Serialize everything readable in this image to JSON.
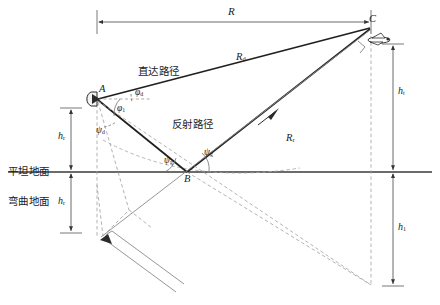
{
  "diagram": {
    "background": "#ffffff",
    "stroke_solid": "#262626",
    "stroke_dashed": "#9a9a9a",
    "stroke_thin": "#8c8c8c",
    "ground_color": "#3a3a3a"
  },
  "points": {
    "a": {
      "label": "A",
      "x": 97,
      "y": 98,
      "desc": "radar-antenna-point"
    },
    "b": {
      "label": "B",
      "x": 187,
      "y": 172,
      "desc": "ground-reflection-point"
    },
    "c": {
      "label": "C",
      "x": 371,
      "y": 26,
      "desc": "target-aircraft-point"
    }
  },
  "paths": {
    "direct_label": "直达路径",
    "reflected_label": "反射路径",
    "direct_range": "R",
    "direct_range_sub": "d",
    "reflected_range": "R",
    "reflected_range_sub": "r"
  },
  "dimensions": {
    "range": {
      "symbol": "R",
      "sub": "",
      "desc": "horizontal ground range"
    },
    "radar_height": {
      "symbol": "h",
      "sub": "r",
      "desc": "radar antenna height"
    },
    "target_height": {
      "symbol": "h",
      "sub": "t",
      "desc": "target height above flat ground"
    },
    "image_height": {
      "symbol": "h",
      "sub": "1",
      "desc": "image height below ground"
    },
    "mirror_radar_height": {
      "symbol": "h",
      "sub": "r",
      "desc": "mirrored radar height"
    }
  },
  "angles": {
    "phi_d": {
      "symbol": "φ",
      "sub": "d",
      "desc": "direct path elevation angle at A"
    },
    "phi_1": {
      "symbol": "φ",
      "sub": "1",
      "desc": "reflected path depression angle at A"
    },
    "psi_d": {
      "symbol": "ψ",
      "sub": "d",
      "desc": "angle to mirrored radar at A"
    },
    "psi_g_left": {
      "symbol": "ψ",
      "sub": "g",
      "desc": "grazing angle incident at B"
    },
    "psi_g_right": {
      "symbol": "ψ",
      "sub": "g",
      "desc": "grazing angle reflected at B"
    }
  },
  "ground": {
    "flat_label": "平坦地面",
    "curved_label": "弯曲地面"
  },
  "icons": {
    "antenna": "radar-antenna-icon",
    "antenna_mirror": "radar-antenna-mirror-icon",
    "aircraft": "aircraft-icon",
    "arrow_direct": "direction-arrow-icon",
    "arrow_reflected": "direction-arrow-icon"
  }
}
